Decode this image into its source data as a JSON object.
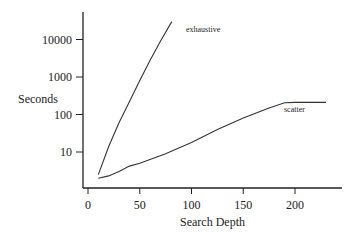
{
  "chart_data": {
    "type": "line",
    "title": "",
    "xlabel": "Search Depth",
    "ylabel": "Seconds",
    "xscale": "linear",
    "yscale": "log",
    "xlim": [
      0,
      245
    ],
    "ylim": [
      1,
      60000
    ],
    "xticks": [
      0,
      50,
      100,
      150,
      200
    ],
    "xtick_labels": [
      "0",
      "50",
      "100",
      "150",
      "200"
    ],
    "yticks": [
      10,
      100,
      1000,
      10000
    ],
    "ytick_labels": [
      "10",
      "100",
      "1000",
      "10000"
    ],
    "grid": false,
    "legend": "inline labels",
    "series": [
      {
        "name": "exhaustive",
        "x": [
          10,
          20,
          30,
          40,
          50,
          60,
          70,
          81
        ],
        "y": [
          2.5,
          14,
          60,
          220,
          800,
          2800,
          9000,
          30000
        ]
      },
      {
        "name": "scatter",
        "x": [
          10,
          20,
          30,
          40,
          50,
          75,
          100,
          125,
          150,
          175,
          190,
          200,
          230
        ],
        "y": [
          2,
          2.3,
          3,
          4.2,
          5,
          9,
          18,
          40,
          80,
          150,
          205,
          210,
          210
        ]
      }
    ]
  }
}
